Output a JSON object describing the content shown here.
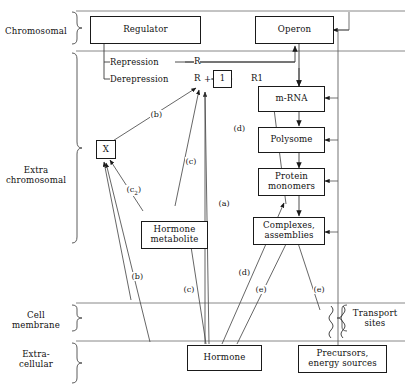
{
  "figure": {
    "compartments": [
      {
        "id": "chromosomal",
        "label": "Chromosomal"
      },
      {
        "id": "extrachromosomal",
        "label": "Extra\nchromosomal",
        "line1": "Extra",
        "line2": "chromosomal"
      },
      {
        "id": "cellmembrane",
        "label": "Cell\nmembrane",
        "line1": "Cell",
        "line2": "membrane"
      },
      {
        "id": "extracellular",
        "label": "Extra-\ncellular",
        "line1": "Extra-",
        "line2": "cellular"
      }
    ],
    "nodes": [
      {
        "id": "regulator",
        "line1": "Regulator",
        "line2": ""
      },
      {
        "id": "operon",
        "line1": "Operon",
        "line2": ""
      },
      {
        "id": "one",
        "line1": "1",
        "line2": ""
      },
      {
        "id": "mrna",
        "line1": "m-RNA",
        "line2": ""
      },
      {
        "id": "polysome",
        "line1": "Polysome",
        "line2": ""
      },
      {
        "id": "protein",
        "line1": "Protein",
        "line2": "monomers"
      },
      {
        "id": "complexes",
        "line1": "Complexes,",
        "line2": "assemblies"
      },
      {
        "id": "x",
        "line1": "X",
        "line2": ""
      },
      {
        "id": "metabolite",
        "line1": "Hormone",
        "line2": "metabolite"
      },
      {
        "id": "hormone",
        "line1": "Hormone",
        "line2": ""
      },
      {
        "id": "precursors",
        "line1": "Precursors,",
        "line2": "energy sources"
      },
      {
        "id": "transport",
        "line1": "Transport",
        "line2": "sites"
      }
    ],
    "flows": [
      {
        "id": "repression",
        "label": "Repression"
      },
      {
        "id": "derepression",
        "label": "Derepression"
      }
    ],
    "symbols": [
      {
        "id": "r-repression",
        "text": "R"
      },
      {
        "id": "r-derepression",
        "text": "R"
      },
      {
        "id": "plus",
        "text": "+"
      },
      {
        "id": "r1",
        "text": "R1"
      }
    ],
    "edge_labels": [
      {
        "id": "label-b-upper",
        "text": "(b)"
      },
      {
        "id": "label-c-upper",
        "text": "(c)"
      },
      {
        "id": "label-d-upper",
        "text": "(d)"
      },
      {
        "id": "label-c2",
        "text": "(c",
        "sub": "2",
        "close": ")"
      },
      {
        "id": "label-a",
        "text": "(a)"
      },
      {
        "id": "label-d-lower",
        "text": "(d)"
      },
      {
        "id": "label-b-lower",
        "text": "(b)"
      },
      {
        "id": "label-c-lower",
        "text": "(c)"
      },
      {
        "id": "label-e-left",
        "text": "(e)"
      },
      {
        "id": "label-e-right",
        "text": "(e)"
      }
    ],
    "colors": {
      "stroke": "#1a1a1a",
      "thin": "#555555",
      "background": "#ffffff",
      "text": "#111111"
    }
  }
}
